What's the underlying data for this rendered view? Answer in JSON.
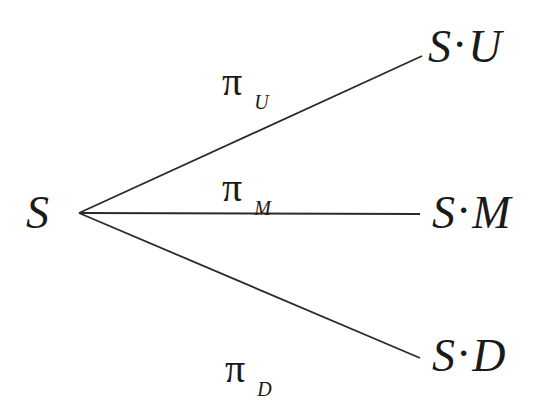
{
  "diagram": {
    "type": "trinomial-tree",
    "origin": {
      "label": "S"
    },
    "branches": [
      {
        "id": "up",
        "probability_symbol": "π",
        "probability_subscript": "U",
        "node_left": "S",
        "node_sep": "·",
        "node_right": "U"
      },
      {
        "id": "middle",
        "probability_symbol": "π",
        "probability_subscript": "M",
        "node_left": "S",
        "node_sep": "·",
        "node_right": "M"
      },
      {
        "id": "down",
        "probability_symbol": "π",
        "probability_subscript": "D",
        "node_left": "S",
        "node_sep": "·",
        "node_right": "D"
      }
    ],
    "colors": {
      "line": "#2a2a2a",
      "text": "#1a1a1a",
      "background": "#ffffff"
    }
  }
}
